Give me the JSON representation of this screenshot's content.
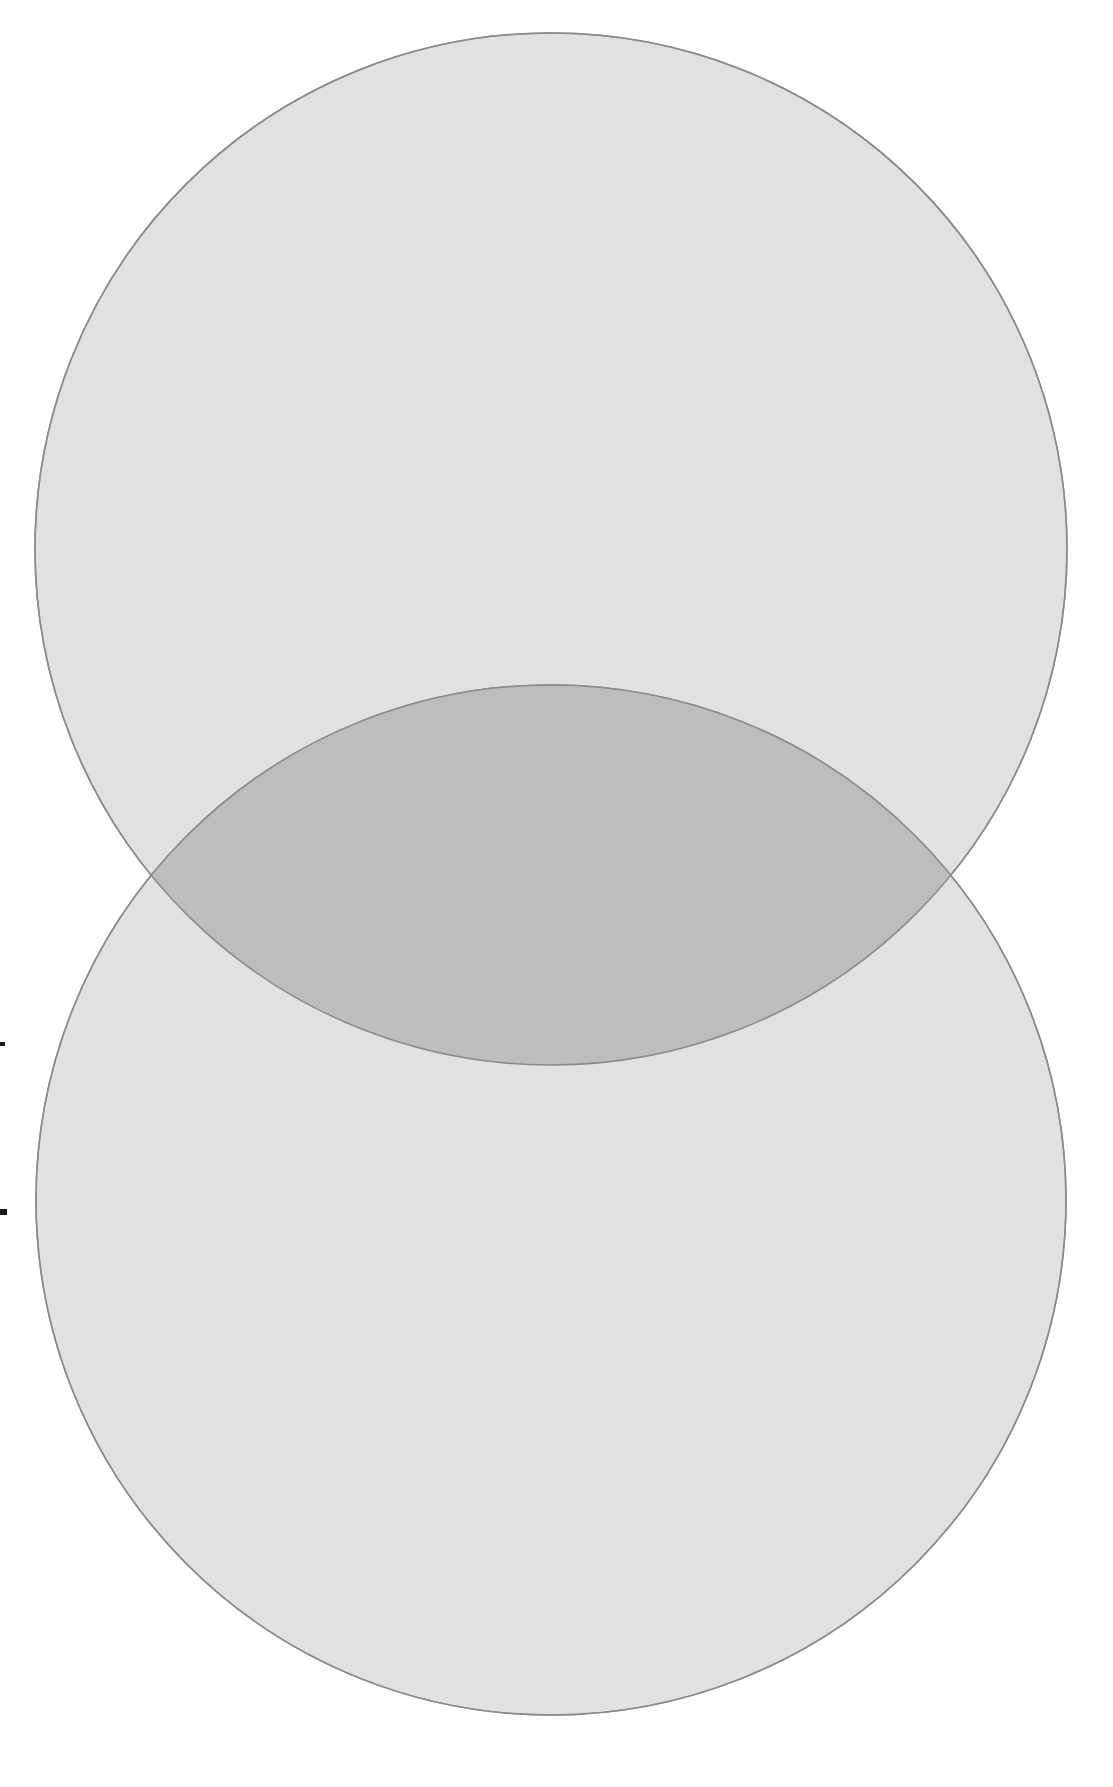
{
  "figure": {
    "kind": "venn-diagram",
    "title": "",
    "caption": "",
    "background_color": "#ffffff",
    "width": 1113,
    "height": 1787
  },
  "chart_data": {
    "type": "venn",
    "title": "",
    "subtitle": "",
    "xlabel": "",
    "ylabel": "",
    "legend_position": "none",
    "grid": false,
    "sets": [
      {
        "name": "set-a",
        "label": "",
        "value": "",
        "center_x": 551,
        "center_y": 549,
        "radius": 516,
        "fill": "#dedede",
        "stroke": "#8a8a8a",
        "stroke_width": 1.5,
        "opacity": 0.85
      },
      {
        "name": "set-b",
        "label": "",
        "value": "",
        "center_x": 551,
        "center_y": 1200,
        "radius": 515,
        "fill": "#dedede",
        "stroke": "#8a8a8a",
        "stroke_width": 1.5,
        "opacity": 0.85
      }
    ],
    "intersection": {
      "name": "set-a-and-set-b",
      "label": "",
      "value": "",
      "fill": "#bdbdbd",
      "left_point_x": 162,
      "left_point_y": 876,
      "right_point_x": 940,
      "right_point_y": 876
    },
    "annotations": [
      {
        "name": "margin-tick-upper",
        "x": 0,
        "y": 1042,
        "width": 5,
        "height": 4,
        "color": "#1a1a1a"
      },
      {
        "name": "margin-tick-lower",
        "x": 0,
        "y": 1209,
        "width": 7,
        "height": 6,
        "color": "#1a1a1a"
      }
    ],
    "colors": {
      "set_fill": "#dedede",
      "overlap_fill": "#bdbdbd",
      "outline": "#8a8a8a",
      "background": "#ffffff",
      "tick": "#1a1a1a"
    }
  }
}
